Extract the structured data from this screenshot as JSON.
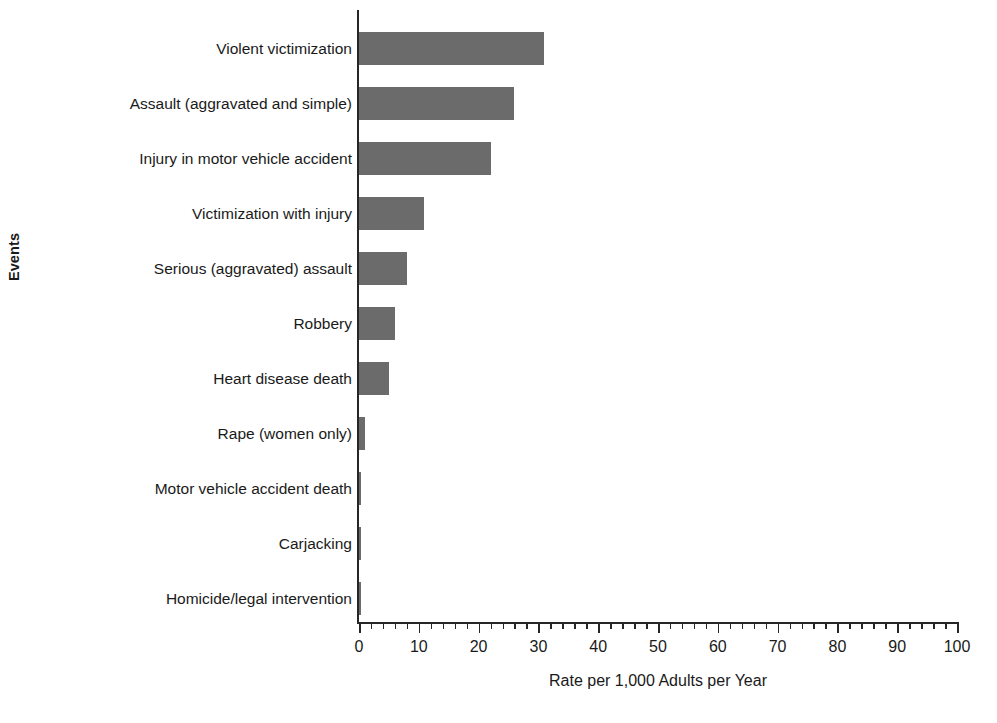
{
  "chart_data": {
    "type": "bar",
    "orientation": "horizontal",
    "title": "",
    "subtitle": "",
    "xlabel": "Rate per 1,000 Adults per Year",
    "ylabel": "Events",
    "xlim": [
      0,
      100
    ],
    "xticks": [
      0,
      10,
      20,
      30,
      40,
      50,
      60,
      70,
      80,
      90,
      100
    ],
    "xtick_labels": [
      "0",
      "10",
      "20",
      "30",
      "40",
      "50",
      "60",
      "70",
      "80",
      "90",
      "100"
    ],
    "minor_tick_interval": 2,
    "grid": false,
    "legend": null,
    "bar_color": "#6b6b6b",
    "axis_color": "#262626",
    "background_color": "#ffffff",
    "categories": [
      "Violent victimization",
      "Assault (aggravated and simple)",
      "Injury in motor vehicle accident",
      "Victimization with injury",
      "Serious (aggravated) assault",
      "Robbery",
      "Heart disease death",
      "Rape (women only)",
      "Motor vehicle accident death",
      "Carjacking",
      "Homicide/legal intervention"
    ],
    "values": [
      31,
      26,
      22,
      10.8,
      8,
      6,
      5,
      1,
      0.2,
      0.2,
      0.2
    ]
  }
}
